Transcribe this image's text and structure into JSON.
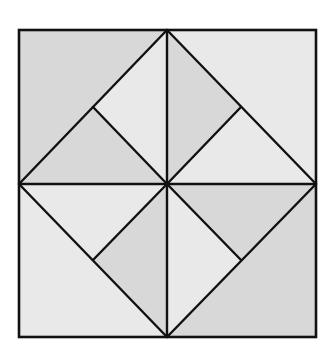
{
  "figure": {
    "width": 328,
    "height": 349,
    "colors": {
      "background": "#ffffff",
      "dark_shade": "#d8d8d8",
      "light_shade": "#e9e9e9",
      "line": "#111111"
    },
    "points": {
      "TL": [
        19,
        30
      ],
      "TR": [
        316,
        30
      ],
      "BL": [
        19,
        337
      ],
      "BR": [
        316,
        337
      ],
      "T": [
        167,
        30
      ],
      "L": [
        19,
        184
      ],
      "R": [
        316,
        184
      ],
      "B": [
        167,
        337
      ],
      "C": [
        167,
        184
      ],
      "M1": [
        93,
        107
      ],
      "M2": [
        241,
        107
      ],
      "M3": [
        93,
        260
      ],
      "M4": [
        241,
        260
      ]
    },
    "regions": [
      {
        "name": "corner-top-left",
        "pts": [
          "TL",
          "T",
          "L"
        ],
        "shade": "dark"
      },
      {
        "name": "corner-top-right",
        "pts": [
          "T",
          "TR",
          "R"
        ],
        "shade": "light"
      },
      {
        "name": "corner-bottom-left",
        "pts": [
          "L",
          "B",
          "BL"
        ],
        "shade": "light"
      },
      {
        "name": "corner-bottom-right",
        "pts": [
          "R",
          "BR",
          "B"
        ],
        "shade": "dark"
      },
      {
        "name": "upper-left-outer",
        "pts": [
          "T",
          "M1",
          "C"
        ],
        "shade": "light"
      },
      {
        "name": "upper-left-inner",
        "pts": [
          "M1",
          "L",
          "C"
        ],
        "shade": "dark"
      },
      {
        "name": "upper-right-outer",
        "pts": [
          "T",
          "M2",
          "C"
        ],
        "shade": "dark"
      },
      {
        "name": "upper-right-inner",
        "pts": [
          "M2",
          "R",
          "C"
        ],
        "shade": "light"
      },
      {
        "name": "lower-left-outer",
        "pts": [
          "L",
          "M3",
          "C"
        ],
        "shade": "light"
      },
      {
        "name": "lower-left-inner",
        "pts": [
          "M3",
          "B",
          "C"
        ],
        "shade": "dark"
      },
      {
        "name": "lower-right-outer",
        "pts": [
          "R",
          "M4",
          "C"
        ],
        "shade": "dark"
      },
      {
        "name": "lower-right-inner",
        "pts": [
          "M4",
          "B",
          "C"
        ],
        "shade": "light"
      }
    ],
    "segments": [
      {
        "name": "diamond-edge-top-left",
        "from": "T",
        "to": "L"
      },
      {
        "name": "diamond-edge-top-right",
        "from": "T",
        "to": "R"
      },
      {
        "name": "diamond-edge-bottom-left",
        "from": "L",
        "to": "B"
      },
      {
        "name": "diamond-edge-bottom-right",
        "from": "R",
        "to": "B"
      },
      {
        "name": "vertical-axis",
        "from": "T",
        "to": "B"
      },
      {
        "name": "horizontal-axis",
        "from": "L",
        "to": "R"
      },
      {
        "name": "spoke-upper-left",
        "from": "M1",
        "to": "C"
      },
      {
        "name": "spoke-upper-right",
        "from": "M2",
        "to": "C"
      },
      {
        "name": "spoke-lower-left",
        "from": "M3",
        "to": "C"
      },
      {
        "name": "spoke-lower-right",
        "from": "M4",
        "to": "C"
      }
    ],
    "frame": {
      "x": 19,
      "y": 30,
      "w": 297,
      "h": 307
    }
  }
}
